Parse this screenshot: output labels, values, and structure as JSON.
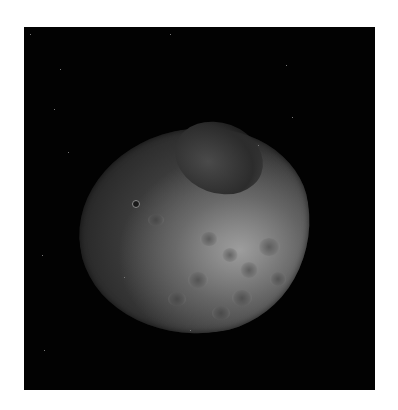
{
  "image": {
    "subject": "grayscale photograph of a partially illuminated planetary moon against black space",
    "frame_color": "#020202",
    "background_color": "#ffffff"
  },
  "features": {
    "craters": [
      {
        "x": 258,
        "y": 238,
        "w": 22,
        "h": 18
      },
      {
        "x": 240,
        "y": 262,
        "w": 18,
        "h": 16
      },
      {
        "x": 222,
        "y": 248,
        "w": 16,
        "h": 14
      },
      {
        "x": 270,
        "y": 272,
        "w": 16,
        "h": 14
      },
      {
        "x": 200,
        "y": 232,
        "w": 18,
        "h": 14
      },
      {
        "x": 188,
        "y": 272,
        "w": 20,
        "h": 16
      },
      {
        "x": 232,
        "y": 290,
        "w": 20,
        "h": 16
      },
      {
        "x": 168,
        "y": 292,
        "w": 18,
        "h": 14
      },
      {
        "x": 212,
        "y": 306,
        "w": 18,
        "h": 14
      },
      {
        "x": 148,
        "y": 214,
        "w": 16,
        "h": 12
      }
    ],
    "small_crater": {
      "x": 135,
      "y": 203
    }
  }
}
